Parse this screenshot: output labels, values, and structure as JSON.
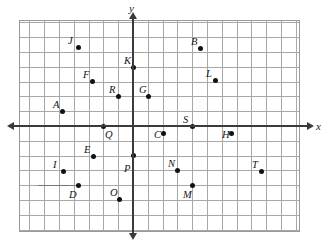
{
  "figure": {
    "type": "coordinate-plane",
    "title": "",
    "background_color": "#ffffff",
    "grid_color": "#a8a8a8",
    "axis_color": "#3a3a3a",
    "point_color": "#111111"
  },
  "axes": {
    "x_label": "x",
    "y_label": "y",
    "x_axis_arrow_left": "◀",
    "x_axis_arrow_right": "▶",
    "y_axis_arrow_up": "▲",
    "y_axis_arrow_down": "▼"
  },
  "chart_data": {
    "type": "scatter",
    "title": "",
    "xlabel": "x",
    "ylabel": "y",
    "grid": true,
    "legend": "none",
    "unit_px": 14.8,
    "origin_px": {
      "x": 133,
      "y": 126
    },
    "xlim": [
      -7.7,
      11.3
    ],
    "ylim": [
      -7.2,
      7.2
    ],
    "labels": [
      "A",
      "B",
      "C",
      "D",
      "E",
      "F",
      "G",
      "H",
      "I",
      "J",
      "K",
      "L",
      "M",
      "N",
      "O",
      "P",
      "Q",
      "R",
      "S",
      "T"
    ],
    "points": [
      {
        "label": "A",
        "x": -4.8,
        "y": 1.0,
        "px": 62,
        "py": 111,
        "label_px": 53,
        "label_py": 100
      },
      {
        "label": "B",
        "x": 4.5,
        "y": 5.3,
        "px": 200,
        "py": 48,
        "label_px": 191,
        "label_py": 37
      },
      {
        "label": "C",
        "x": 2.0,
        "y": -0.5,
        "px": 163,
        "py": 133,
        "label_px": 154,
        "label_py": 130
      },
      {
        "label": "D",
        "x": -3.7,
        "y": -4.0,
        "px": 78,
        "py": 185,
        "label_px": 69,
        "label_py": 190
      },
      {
        "label": "E",
        "x": -2.2,
        "y": -2.7,
        "px": 93,
        "py": 156,
        "label_px": 84,
        "label_py": 145
      },
      {
        "label": "F",
        "x": -3.0,
        "y": 3.0,
        "px": 92,
        "py": 81,
        "label_px": 83,
        "label_py": 70
      },
      {
        "label": "G",
        "x": 1.0,
        "y": 2.0,
        "px": 148,
        "py": 96,
        "label_px": 139,
        "label_py": 85
      },
      {
        "label": "H",
        "x": 6.6,
        "y": -0.5,
        "px": 231,
        "py": 133,
        "label_px": 222,
        "label_py": 130
      },
      {
        "label": "I",
        "x": -4.7,
        "y": -3.0,
        "px": 63,
        "py": 171,
        "label_px": 53,
        "label_py": 160
      },
      {
        "label": "J",
        "x": -3.7,
        "y": 5.3,
        "px": 78,
        "py": 47,
        "label_px": 68,
        "label_py": 36
      },
      {
        "label": "K",
        "x": 0.0,
        "y": 4.0,
        "px": 133,
        "py": 67,
        "label_px": 124,
        "label_py": 56
      },
      {
        "label": "L",
        "x": 5.5,
        "y": 3.0,
        "px": 215,
        "py": 80,
        "label_px": 206,
        "label_py": 69
      },
      {
        "label": "M",
        "x": 3.3,
        "y": -4.0,
        "px": 192,
        "py": 185,
        "label_px": 183,
        "label_py": 190
      },
      {
        "label": "N",
        "x": 2.7,
        "y": -3.0,
        "px": 177,
        "py": 170,
        "label_px": 168,
        "label_py": 159
      },
      {
        "label": "O",
        "x": -1.2,
        "y": -4.8,
        "px": 119,
        "py": 199,
        "label_px": 110,
        "label_py": 188
      },
      {
        "label": "P",
        "x": 0.0,
        "y": -2.3,
        "px": 133,
        "py": 155,
        "label_px": 124,
        "label_py": 164
      },
      {
        "label": "Q",
        "x": -2.0,
        "y": 0.0,
        "px": 103,
        "py": 126,
        "label_px": 105,
        "label_py": 130
      },
      {
        "label": "R",
        "x": -1.0,
        "y": 2.0,
        "px": 118,
        "py": 96,
        "label_px": 109,
        "label_py": 85
      },
      {
        "label": "S",
        "x": 4.0,
        "y": 0.0,
        "px": 192,
        "py": 126,
        "label_px": 183,
        "label_py": 115
      },
      {
        "label": "T",
        "x": 8.0,
        "y": -3.0,
        "px": 261,
        "py": 171,
        "label_px": 252,
        "label_py": 160
      }
    ]
  },
  "annotations": {
    "stray_segment": {
      "x1_px": 38,
      "x2_px": 78,
      "y_px": 185
    }
  }
}
